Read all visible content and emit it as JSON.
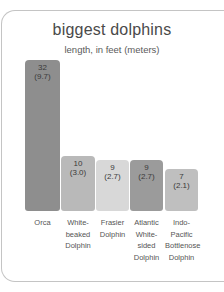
{
  "chart_data": {
    "type": "bar",
    "title": "biggest dolphins",
    "subtitle": "length, in feet (meters)",
    "xlabel": "",
    "ylabel": "length, in feet (meters)",
    "ylim": [
      0,
      32
    ],
    "grid": false,
    "legend": "none",
    "categories": [
      "Orca",
      "White-beaked Dolphin",
      "Frasier Dolphin",
      "Atlantic White-sided Dolphin",
      "Indo-Pacific Bottlenose Dolphin"
    ],
    "values": [
      32,
      10,
      9,
      9,
      7
    ],
    "values_meters": [
      9.7,
      3.0,
      2.7,
      2.7,
      2.1
    ],
    "bars": [
      {
        "label_lines": [
          "Orca"
        ],
        "value": "32",
        "meters": "(9.7)",
        "color": "#8e8e8e",
        "x": 0,
        "w": 35
      },
      {
        "label_lines": [
          "White-",
          "beaked",
          "Dolphin"
        ],
        "value": "10",
        "meters": "(3.0)",
        "color": "#b9b9b9",
        "x": 36,
        "w": 34
      },
      {
        "label_lines": [
          "Frasier",
          "Dolphin"
        ],
        "value": "9",
        "meters": "(2.7)",
        "color": "#d8d8d8",
        "x": 71,
        "w": 33
      },
      {
        "label_lines": [
          "Atlantic",
          "White-",
          "sided",
          "Dolphin"
        ],
        "value": "9",
        "meters": "(2.7)",
        "color": "#9b9b9b",
        "x": 105,
        "w": 33
      },
      {
        "label_lines": [
          "Indo-",
          "Pacific",
          "Bottlenose",
          "Dolphin"
        ],
        "value": "7",
        "meters": "(2.1)",
        "color": "#bfbfbf",
        "x": 140,
        "w": 33
      }
    ]
  }
}
